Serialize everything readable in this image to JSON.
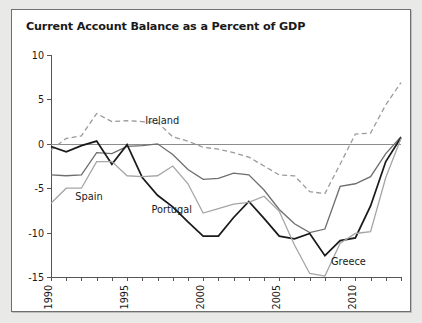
{
  "figure": {
    "title": "Current Account Balance as a Percent of GDP"
  },
  "chart_data": {
    "type": "line",
    "title": "Current Account Balance as a Percent of GDP",
    "xlabel": "",
    "ylabel": "",
    "xlim": [
      1990,
      2013
    ],
    "ylim": [
      -15,
      10
    ],
    "yticks": [
      10,
      5,
      0,
      -5,
      -10,
      -15
    ],
    "ytick_labels": [
      "10",
      "5",
      "0",
      "-5",
      "-10",
      "-15"
    ],
    "xticks": [
      1990,
      1991,
      1992,
      1993,
      1994,
      1995,
      1996,
      1997,
      1998,
      1999,
      2000,
      2001,
      2002,
      2003,
      2004,
      2005,
      2006,
      2007,
      2008,
      2009,
      2010,
      2011,
      2012,
      2013
    ],
    "xtick_labels_shown": [
      "1990",
      "1995",
      "2000",
      "2005",
      "2010"
    ],
    "xtick_labels_shown_at": [
      1990,
      1995,
      2000,
      2005,
      2010
    ],
    "grid": false,
    "zero_line": true,
    "legend": "inline-annotations",
    "x": [
      1990,
      1991,
      1992,
      1993,
      1994,
      1995,
      1996,
      1997,
      1998,
      1999,
      2000,
      2001,
      2002,
      2003,
      2004,
      2005,
      2006,
      2007,
      2008,
      2009,
      2010,
      2011,
      2012,
      2013
    ],
    "series": [
      {
        "name": "Ireland",
        "style": "dashed",
        "color": "#9a9a9a",
        "label_x": 1996.2,
        "label_y": 2.2,
        "values": [
          -0.7,
          0.6,
          0.9,
          3.4,
          2.5,
          2.6,
          2.5,
          2.4,
          0.8,
          0.3,
          -0.4,
          -0.6,
          -1.0,
          -1.5,
          -2.5,
          -3.5,
          -3.6,
          -5.4,
          -5.6,
          -2.3,
          1.1,
          1.2,
          4.4,
          6.9
        ]
      },
      {
        "name": "Spain",
        "style": "solid",
        "color": "#6e6e6e",
        "label_x": 1991.6,
        "label_y": -6.3,
        "values": [
          -3.5,
          -3.6,
          -3.5,
          -1.0,
          -1.1,
          -0.3,
          -0.2,
          0.0,
          -1.2,
          -2.9,
          -4.0,
          -3.9,
          -3.3,
          -3.5,
          -5.2,
          -7.4,
          -9.0,
          -10.0,
          -9.6,
          -4.8,
          -4.5,
          -3.7,
          -1.1,
          0.8
        ]
      },
      {
        "name": "Portugal",
        "style": "solid",
        "color": "#1a1a1a",
        "label_x": 1996.6,
        "label_y": -7.8,
        "values": [
          -0.3,
          -0.9,
          -0.2,
          0.3,
          -2.3,
          -0.1,
          -3.8,
          -5.8,
          -7.1,
          -8.8,
          -10.4,
          -10.4,
          -8.3,
          -6.5,
          -8.4,
          -10.4,
          -10.7,
          -10.1,
          -12.6,
          -10.9,
          -10.6,
          -7.0,
          -2.0,
          0.7
        ]
      },
      {
        "name": "Greece",
        "style": "solid",
        "color": "#a5a5a5",
        "label_x": 2008.4,
        "label_y": -13.6,
        "values": [
          -6.7,
          -5.0,
          -5.0,
          -2.0,
          -2.0,
          -3.6,
          -3.7,
          -3.6,
          -2.5,
          -4.5,
          -7.8,
          -7.3,
          -6.8,
          -6.6,
          -5.9,
          -7.6,
          -11.4,
          -14.6,
          -14.9,
          -11.2,
          -10.1,
          -9.9,
          -3.8,
          0.6
        ]
      }
    ]
  }
}
